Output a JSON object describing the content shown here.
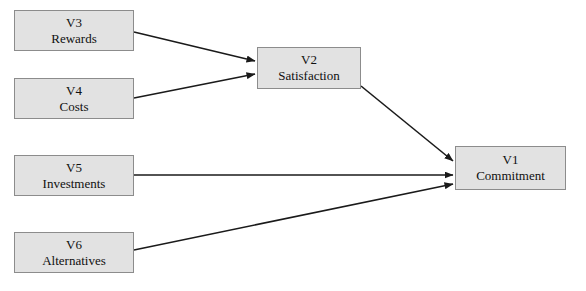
{
  "diagram": {
    "type": "path-model",
    "background_color": "#ffffff",
    "node_fill_color": "#e2e2e2",
    "node_border_color": "#8c8c8c",
    "edge_color": "#1a1a1a",
    "nodes": [
      {
        "id": "v3",
        "code": "V3",
        "name": "Rewards",
        "x": 14,
        "y": 10,
        "width": 120,
        "height": 41
      },
      {
        "id": "v4",
        "code": "V4",
        "name": "Costs",
        "x": 14,
        "y": 78,
        "width": 120,
        "height": 41
      },
      {
        "id": "v5",
        "code": "V5",
        "name": "Investments",
        "x": 14,
        "y": 155,
        "width": 120,
        "height": 41
      },
      {
        "id": "v6",
        "code": "V6",
        "name": "Alternatives",
        "x": 14,
        "y": 232,
        "width": 120,
        "height": 41
      },
      {
        "id": "v2",
        "code": "V2",
        "name": "Satisfaction",
        "x": 257,
        "y": 47,
        "width": 104,
        "height": 42
      },
      {
        "id": "v1",
        "code": "V1",
        "name": "Commitment",
        "x": 455,
        "y": 146,
        "width": 111,
        "height": 44
      }
    ],
    "edges": [
      {
        "id": "v3-to-v2",
        "from": "v3",
        "to": "v2",
        "x1": 134,
        "y1": 32,
        "x2": 255,
        "y2": 61
      },
      {
        "id": "v4-to-v2",
        "from": "v4",
        "to": "v2",
        "x1": 134,
        "y1": 98,
        "x2": 255,
        "y2": 74
      },
      {
        "id": "v2-to-v1",
        "from": "v2",
        "to": "v1",
        "x1": 361,
        "y1": 86,
        "x2": 453,
        "y2": 161
      },
      {
        "id": "v5-to-v1",
        "from": "v5",
        "to": "v1",
        "x1": 134,
        "y1": 175,
        "x2": 453,
        "y2": 175
      },
      {
        "id": "v6-to-v1",
        "from": "v6",
        "to": "v1",
        "x1": 134,
        "y1": 250,
        "x2": 453,
        "y2": 184
      }
    ]
  }
}
